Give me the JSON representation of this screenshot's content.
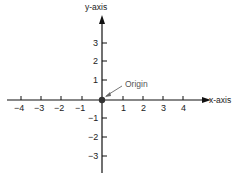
{
  "diagram": {
    "y_axis_label": "y-axis",
    "x_axis_label": "x-axis",
    "origin_label": "Origin",
    "x_ticks": [
      "−4",
      "−3",
      "−2",
      "−1",
      "1",
      "2",
      "3",
      "4"
    ],
    "y_ticks": [
      "3",
      "2",
      "1",
      "−1",
      "−2",
      "−3"
    ],
    "colors": {
      "axis": "#111111",
      "origin_dot": "#333333",
      "origin_label": "#555555"
    }
  }
}
